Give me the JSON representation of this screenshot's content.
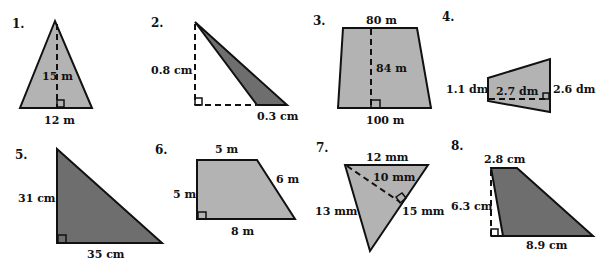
{
  "problems": [
    {
      "number": "1.",
      "shape": "triangle",
      "fill": "#b3b3b3",
      "labels": {
        "height": "15 m",
        "base": "12 m"
      }
    },
    {
      "number": "2.",
      "shape": "triangle",
      "fill": "#6e6e6e",
      "labels": {
        "height": "0.8 cm",
        "base": "0.3 cm"
      }
    },
    {
      "number": "3.",
      "shape": "trapezoid",
      "fill": "#b3b3b3",
      "labels": {
        "top": "80 m",
        "height": "84 m",
        "bottom": "100 m"
      }
    },
    {
      "number": "4.",
      "shape": "trapezoid",
      "fill": "#b3b3b3",
      "labels": {
        "left": "1.1 dm",
        "height": "2.7 dm",
        "right": "2.6 dm"
      }
    },
    {
      "number": "5.",
      "shape": "triangle",
      "fill": "#6e6e6e",
      "labels": {
        "height": "31 cm",
        "base": "35 cm"
      }
    },
    {
      "number": "6.",
      "shape": "trapezoid",
      "fill": "#b3b3b3",
      "labels": {
        "top": "5 m",
        "left": "5 m",
        "slant": "6 m",
        "bottom": "8 m"
      }
    },
    {
      "number": "7.",
      "shape": "triangle",
      "fill": "#b3b3b3",
      "labels": {
        "top": "12 mm",
        "height": "10 mm",
        "left": "13 mm",
        "base": "15 mm"
      }
    },
    {
      "number": "8.",
      "shape": "trapezoid",
      "fill": "#6e6e6e",
      "labels": {
        "top": "2.8 cm",
        "height": "6.3 cm",
        "bottom": "8.9 cm"
      }
    }
  ]
}
